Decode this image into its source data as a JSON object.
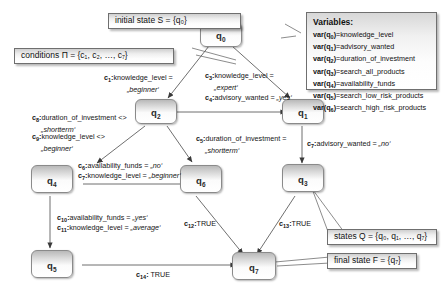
{
  "diagram": {
    "type": "state-transition-diagram"
  },
  "callouts": {
    "initial_state": "initial state S = {q₀}",
    "conditions": "conditions Π = {c₁, c₂, …, c₇}",
    "states": "states Q = {q₀, q₁, …, q₇}",
    "final_state": "final state F = {q₇}"
  },
  "variables_panel": {
    "title": "Variables:",
    "entries": [
      {
        "state": "q₀",
        "name": "var(q₀)",
        "value": "knowledge_level"
      },
      {
        "state": "q₁",
        "name": "var(q₁)",
        "value": "advisory_wanted"
      },
      {
        "state": "q₂",
        "name": "var(q₂)",
        "value": "duration_of_investment"
      },
      {
        "state": "q₃",
        "name": "var(q₃)",
        "value": "search_all_products"
      },
      {
        "state": "q₄",
        "name": "var(q₄)",
        "value": "availability_funds"
      },
      {
        "state": "q₅",
        "name": "var(q₅)",
        "value": "search_low_risk_products"
      },
      {
        "state": "q₆",
        "name": "var(q₆)",
        "value": "search_high_risk_products"
      }
    ]
  },
  "nodes": [
    {
      "id": "q0",
      "label": "q",
      "sub": "0"
    },
    {
      "id": "q1",
      "label": "q",
      "sub": "1"
    },
    {
      "id": "q2",
      "label": "q",
      "sub": "2"
    },
    {
      "id": "q3",
      "label": "q",
      "sub": "3"
    },
    {
      "id": "q4",
      "label": "q",
      "sub": "4"
    },
    {
      "id": "q5",
      "label": "q",
      "sub": "5"
    },
    {
      "id": "q6",
      "label": "q",
      "sub": "6"
    },
    {
      "id": "q7",
      "label": "q",
      "sub": "7"
    }
  ],
  "edge_labels": {
    "c1": {
      "id": "c",
      "sub": "1",
      "text": "knowledge_level =",
      "value": "„beginner‘"
    },
    "c3": {
      "id": "c",
      "sub": "3",
      "text": "knowledge_level =",
      "value": "„expert‘"
    },
    "c4": {
      "id": "c",
      "sub": "4",
      "text": "advisory_wanted = ",
      "value": "„yes‘"
    },
    "c5": {
      "id": "c",
      "sub": "5",
      "text": "duration_of_investment =",
      "value": "„shortterm‘"
    },
    "c6": {
      "id": "c",
      "sub": "6",
      "text": "availability_funds = ",
      "value": "„no‘"
    },
    "c7b": {
      "id": "c",
      "sub": "7",
      "text": "knowledge_level = ",
      "value": "„beginner‘"
    },
    "c7": {
      "id": "c",
      "sub": "7",
      "text": "advisory_wanted = ",
      "value": "„no‘"
    },
    "c8": {
      "id": "c",
      "sub": "8",
      "text": "duration_of_investment <>",
      "value": "„shortterm‘"
    },
    "c9": {
      "id": "c",
      "sub": "9",
      "text": "knowledge_level <>",
      "value": "„beginner‘"
    },
    "c10": {
      "id": "c",
      "sub": "10",
      "text": "availability_funds = ",
      "value": "„yes‘"
    },
    "c11": {
      "id": "c",
      "sub": "11",
      "text": "knowledge_level = ",
      "value": "„average‘"
    },
    "c12": {
      "id": "c",
      "sub": "12",
      "text": "TRUE",
      "value": ""
    },
    "c13": {
      "id": "c",
      "sub": "13",
      "text": "TRUE",
      "value": ""
    },
    "c14": {
      "id": "c",
      "sub": "14",
      "text": "TRUE",
      "value": ""
    }
  },
  "colors": {
    "node_border": "#8a8a8a",
    "box_border": "#6f6f6f",
    "wire": "#4a4a4a",
    "background": "#ffffff"
  }
}
